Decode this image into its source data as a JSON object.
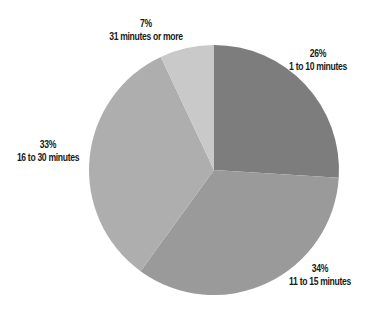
{
  "chart_data": {
    "type": "pie",
    "title": "",
    "start_angle_deg": 0,
    "direction": "clockwise",
    "categories": [
      "1 to 10 minutes",
      "11 to 15 minutes",
      "16 to 30 minutes",
      "31 minutes or more"
    ],
    "values": [
      26,
      34,
      33,
      7
    ],
    "value_labels": [
      "26%",
      "34%",
      "33%",
      "7%"
    ],
    "colors": [
      "#7d7d7d",
      "#9a9a9a",
      "#aeaeae",
      "#c9c9c9"
    ],
    "legend": "none (direct labels)",
    "geometry": {
      "cx": 214,
      "cy": 170,
      "r": 125
    }
  },
  "labels": [
    {
      "pct": "26%",
      "text": "1 to 10 minutes",
      "x": 318,
      "y": 47
    },
    {
      "pct": "34%",
      "text": "11 to 15 minutes",
      "x": 320,
      "y": 262
    },
    {
      "pct": "33%",
      "text": "16 to 30 minutes",
      "x": 48,
      "y": 138
    },
    {
      "pct": "7%",
      "text": "31 minutes or more",
      "x": 146,
      "y": 17
    }
  ]
}
